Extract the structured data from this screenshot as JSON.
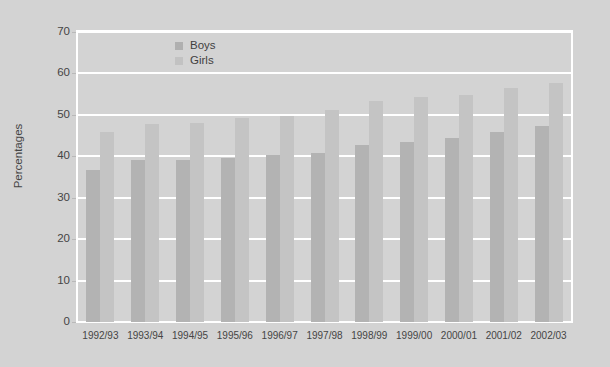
{
  "chart_data": {
    "type": "bar",
    "title": "",
    "subtitle": "",
    "xlabel": "",
    "ylabel": "Percentages",
    "ylim": [
      0,
      70
    ],
    "ytick_step": 10,
    "yticks": [
      0,
      10,
      20,
      30,
      40,
      50,
      60,
      70
    ],
    "grid": "horizontal",
    "legend_position": "top-center",
    "categories": [
      "1992/93",
      "1993/94",
      "1994/95",
      "1995/96",
      "1996/97",
      "1997/98",
      "1998/99",
      "1999/00",
      "2000/01",
      "2001/02",
      "2002/03"
    ],
    "series": [
      {
        "name": "Boys",
        "color": "#b3b3b3",
        "values": [
          36.7,
          39.2,
          39.2,
          39.5,
          40.2,
          40.8,
          42.7,
          43.5,
          44.5,
          45.8,
          47.2
        ]
      },
      {
        "name": "Girls",
        "color": "#c4c4c4",
        "values": [
          45.9,
          47.7,
          48.0,
          49.3,
          49.8,
          51.2,
          53.4,
          54.2,
          54.7,
          56.5,
          57.8
        ]
      }
    ]
  },
  "legend": {
    "items": [
      {
        "label": "Boys",
        "color": "#b0b0b0"
      },
      {
        "label": "Girls",
        "color": "#c2c2c2"
      }
    ]
  },
  "colors": {
    "background": "#d3d3d3",
    "grid": "#ffffff",
    "frame": "#ffffff",
    "text": "#454545",
    "boys": "#b3b3b3",
    "girls": "#c4c4c4"
  }
}
